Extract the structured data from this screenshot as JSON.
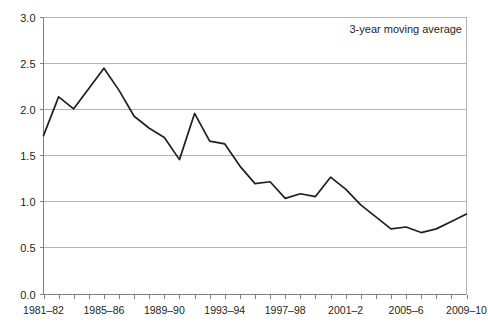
{
  "chart_data": {
    "type": "line",
    "title": "",
    "subtitle": "",
    "xlabel": "",
    "ylabel": "",
    "ylim": [
      0.0,
      3.0
    ],
    "ytick_step": 0.5,
    "ytick_labels": [
      "0.0",
      "0.5",
      "1.0",
      "1.5",
      "2.0",
      "2.5",
      "3.0"
    ],
    "ytick_values": [
      0.0,
      0.5,
      1.0,
      1.5,
      2.0,
      2.5,
      3.0
    ],
    "grid": "horizontal",
    "legend": "none",
    "annotations": [
      {
        "text": "3-year moving average",
        "position": "top-right"
      }
    ],
    "categories": [
      "1981–82",
      "1982–83",
      "1983–84",
      "1984–85",
      "1985–86",
      "1986–87",
      "1987–88",
      "1988–89",
      "1989–90",
      "1990–91",
      "1991–92",
      "1992–93",
      "1993–94",
      "1994–95",
      "1995–96",
      "1996–97",
      "1997–98",
      "1998–99",
      "1999–2000",
      "2000–1",
      "2001–2",
      "2002–3",
      "2003–4",
      "2004–5",
      "2005–6",
      "2006–7",
      "2007–8",
      "2008–9",
      "2009–10"
    ],
    "xtick_labels_shown": [
      {
        "index": 0,
        "label": "1981–82"
      },
      {
        "index": 4,
        "label": "1985–86"
      },
      {
        "index": 8,
        "label": "1989–90"
      },
      {
        "index": 12,
        "label": "1993–94"
      },
      {
        "index": 16,
        "label": "1997–98"
      },
      {
        "index": 20,
        "label": "2001–2"
      },
      {
        "index": 24,
        "label": "2005–6"
      },
      {
        "index": 28,
        "label": "2009–10"
      }
    ],
    "series": [
      {
        "name": "3-year moving average",
        "color": "#231f20",
        "values": [
          1.71,
          2.13,
          2.0,
          2.22,
          2.44,
          2.2,
          1.92,
          1.79,
          1.69,
          1.45,
          1.95,
          1.65,
          1.62,
          1.38,
          1.19,
          1.21,
          1.03,
          1.08,
          1.05,
          1.26,
          1.13,
          0.96,
          0.83,
          0.7,
          0.72,
          0.66,
          0.7,
          0.78,
          0.86
        ]
      }
    ]
  },
  "colors": {
    "line": "#231f20",
    "grid": "#b3b3b3",
    "axis": "#808080",
    "background": "#ffffff",
    "text": "#231f20"
  }
}
